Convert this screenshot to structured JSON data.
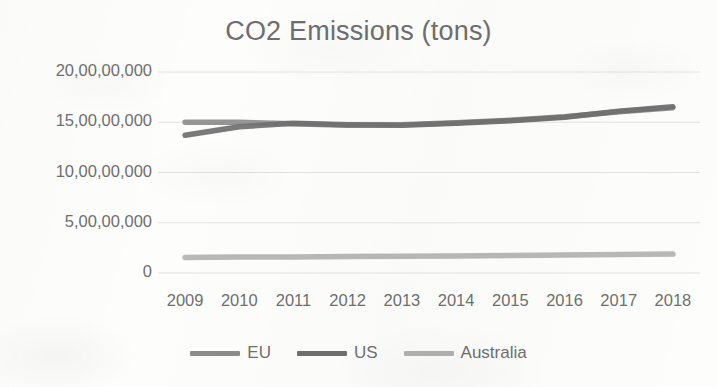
{
  "chart_data": {
    "type": "line",
    "title": "CO2 Emissions (tons)",
    "xlabel": "",
    "ylabel": "",
    "categories": [
      "2009",
      "2010",
      "2011",
      "2012",
      "2013",
      "2014",
      "2015",
      "2016",
      "2017",
      "2018"
    ],
    "ytick_labels": [
      "20,00,00,000",
      "15,00,00,000",
      "10,00,00,000",
      "5,00,00,000",
      "0"
    ],
    "ytick_values": [
      200000000,
      150000000,
      100000000,
      50000000,
      0
    ],
    "ylim": [
      0,
      200000000
    ],
    "grid": true,
    "legend_position": "bottom",
    "series": [
      {
        "name": "EU",
        "color": "#8c8c8c",
        "values": [
          150000000,
          150000000,
          148500000,
          147000000,
          147500000,
          149500000,
          152000000,
          155500000,
          160500000,
          164500000
        ]
      },
      {
        "name": "US",
        "color": "#6f6f6f",
        "values": [
          137000000,
          145500000,
          149000000,
          147500000,
          147000000,
          149000000,
          151500000,
          155000000,
          161000000,
          165500000
        ]
      },
      {
        "name": "Australia",
        "color": "#b2b2b2",
        "values": [
          15500000,
          15800000,
          16000000,
          16300000,
          16600000,
          17000000,
          17400000,
          17800000,
          18300000,
          18800000
        ]
      }
    ]
  },
  "colors": {
    "title_text": "#6e6e6e",
    "axis_text": "#6f6f6f",
    "gridline": "#e2e2e2",
    "background": "#fdfdfc",
    "eu": "#8c8c8c",
    "us": "#6f6f6f",
    "australia": "#b2b2b2"
  },
  "legend": {
    "items": [
      {
        "label": "EU",
        "color": "#8c8c8c"
      },
      {
        "label": "US",
        "color": "#6f6f6f"
      },
      {
        "label": "Australia",
        "color": "#b2b2b2"
      }
    ]
  }
}
